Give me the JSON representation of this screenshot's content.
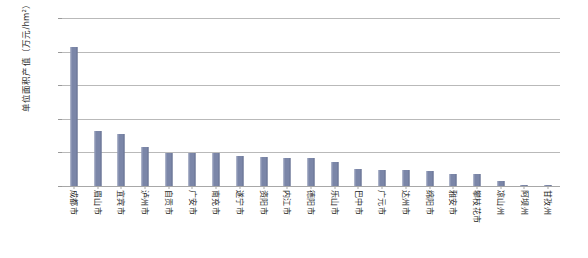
{
  "chart_data": {
    "type": "bar",
    "title": "",
    "subtitle": "",
    "xlabel": "",
    "ylabel": "单位面积产值（万元/hm²）",
    "ylim": [
      0,
      25
    ],
    "yticks": [
      0,
      5,
      10,
      15,
      20,
      25
    ],
    "grid": true,
    "legend": "none",
    "orientation": "vertical",
    "bar_color": "#7b86a8",
    "gridline_color": "#b9b9b9",
    "categories": [
      "成都市",
      "眉山市",
      "宜宾市",
      "泸州市",
      "自贡市",
      "广安市",
      "南充市",
      "遂宁市",
      "资阳市",
      "内江市",
      "德阳市",
      "乐山市",
      "巴中市",
      "广元市",
      "达州市",
      "绵阳市",
      "雅安市",
      "攀枝花市",
      "凉山州",
      "阿坝州",
      "甘孜州"
    ],
    "values": [
      20.7,
      8.2,
      7.8,
      5.8,
      4.9,
      4.9,
      4.9,
      4.4,
      4.3,
      4.2,
      4.2,
      3.5,
      2.6,
      2.4,
      2.4,
      2.2,
      1.8,
      1.8,
      0.7,
      0.2,
      0.05
    ]
  }
}
